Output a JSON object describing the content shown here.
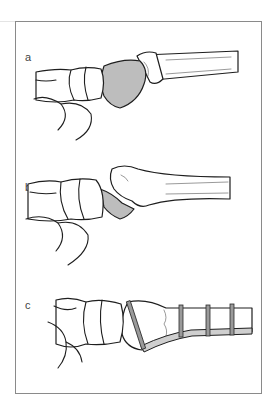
{
  "figure": {
    "panels": [
      {
        "id": "a",
        "label": "a",
        "description": "Dislocated bone fragment (shaded) displaced dorsally from the end of the long bone"
      },
      {
        "id": "b",
        "label": "b",
        "description": "Fractured fragment (shaded) below the articular end of the long bone"
      },
      {
        "id": "c",
        "label": "c",
        "description": "Fixation with a plate and screws along the long bone shaft"
      }
    ],
    "colors": {
      "frame_border": "#8a8a8a",
      "line_art": "#1e1e1e",
      "shaded_fragment": "#bdbdbd",
      "plate": "#cfcfcf",
      "background": "#ffffff"
    }
  }
}
